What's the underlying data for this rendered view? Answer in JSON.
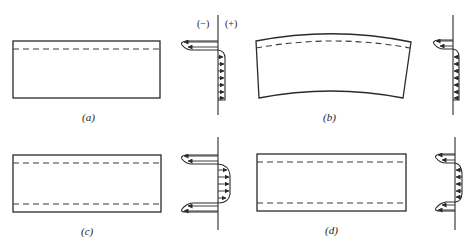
{
  "figure": {
    "sign_labels": {
      "negative": "(−)",
      "positive": "(+)"
    },
    "panels": [
      {
        "id": "a",
        "label": "(a)",
        "shape": "flat plate",
        "dashed_lines": 1,
        "profile": "compressive at top surface, tensile through remainder"
      },
      {
        "id": "b",
        "label": "(b)",
        "shape": "bent plate (curved)",
        "dashed_lines": 1,
        "profile": "compressive at top surface, tensile through remainder"
      },
      {
        "id": "c",
        "label": "(c)",
        "shape": "flat plate",
        "dashed_lines": 2,
        "profile": "compressive at both surfaces, tensile in core"
      },
      {
        "id": "d",
        "label": "(d)",
        "shape": "flat plate",
        "dashed_lines": 2,
        "profile": "compressive at both surfaces, smaller tensile in core"
      }
    ]
  }
}
